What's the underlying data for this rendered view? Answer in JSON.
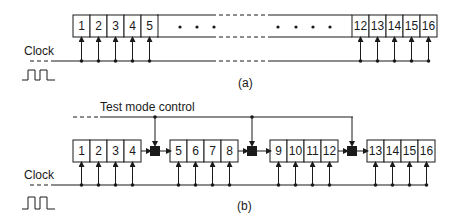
{
  "figure_a": {
    "caption": "(a)",
    "clock_label": "Clock",
    "left_cells": [
      "1",
      "2",
      "3",
      "4",
      "5"
    ],
    "right_cells": [
      "12",
      "13",
      "14",
      "15",
      "16"
    ],
    "ellipsis": "• • • •   • • • •"
  },
  "figure_b": {
    "caption": "(b)",
    "clock_label": "Clock",
    "control_label": "Test mode control",
    "groups": [
      [
        "1",
        "2",
        "3",
        "4"
      ],
      [
        "5",
        "6",
        "7",
        "8"
      ],
      [
        "9",
        "10",
        "11",
        "12"
      ],
      [
        "13",
        "14",
        "15",
        "16"
      ]
    ],
    "mux_count": 3
  },
  "colors": {
    "ink": "#1a1a1a",
    "background": "#ffffff"
  }
}
